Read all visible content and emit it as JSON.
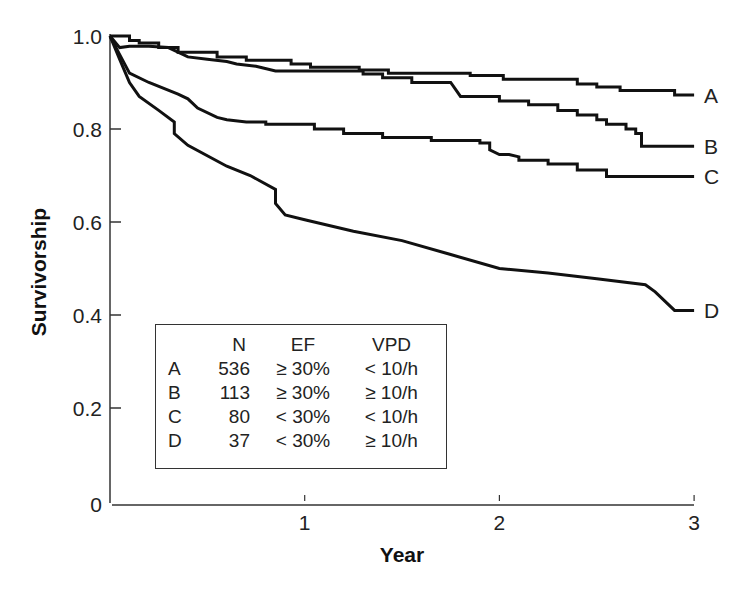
{
  "chart_data": {
    "type": "line",
    "title": "",
    "xlabel": "Year",
    "ylabel": "Survivorship",
    "xlim": [
      0,
      3
    ],
    "ylim": [
      0,
      1.0
    ],
    "x_ticks": [
      "1",
      "2",
      "3"
    ],
    "y_ticks": [
      "0",
      "0.2",
      "0.4",
      "0.6",
      "0.8",
      "1.0"
    ],
    "grid": false,
    "legend_position": "lower-left (inset table)",
    "series": [
      {
        "name": "A",
        "label": "A",
        "points": [
          [
            0,
            1.0
          ],
          [
            0.1,
            1.0
          ],
          [
            0.1,
            0.99
          ],
          [
            0.15,
            0.99
          ],
          [
            0.15,
            0.985
          ],
          [
            0.25,
            0.985
          ],
          [
            0.25,
            0.975
          ],
          [
            0.35,
            0.975
          ],
          [
            0.35,
            0.965
          ],
          [
            0.55,
            0.965
          ],
          [
            0.55,
            0.955
          ],
          [
            0.7,
            0.955
          ],
          [
            0.7,
            0.948
          ],
          [
            0.93,
            0.948
          ],
          [
            0.93,
            0.94
          ],
          [
            1.0,
            0.94
          ],
          [
            1.03,
            0.94
          ],
          [
            1.03,
            0.933
          ],
          [
            1.28,
            0.933
          ],
          [
            1.28,
            0.927
          ],
          [
            1.43,
            0.927
          ],
          [
            1.43,
            0.92
          ],
          [
            1.62,
            0.92
          ],
          [
            1.85,
            0.92
          ],
          [
            1.85,
            0.915
          ],
          [
            2.0,
            0.915
          ],
          [
            2.02,
            0.915
          ],
          [
            2.02,
            0.907
          ],
          [
            2.4,
            0.907
          ],
          [
            2.4,
            0.897
          ],
          [
            2.5,
            0.897
          ],
          [
            2.5,
            0.89
          ],
          [
            2.62,
            0.89
          ],
          [
            2.62,
            0.883
          ],
          [
            2.9,
            0.883
          ],
          [
            2.9,
            0.873
          ],
          [
            3.0,
            0.873
          ]
        ]
      },
      {
        "name": "B",
        "label": "B",
        "points": [
          [
            0,
            1.0
          ],
          [
            0.05,
            0.975
          ],
          [
            0.1,
            0.978
          ],
          [
            0.2,
            0.978
          ],
          [
            0.3,
            0.975
          ],
          [
            0.4,
            0.955
          ],
          [
            0.5,
            0.95
          ],
          [
            0.6,
            0.945
          ],
          [
            0.65,
            0.94
          ],
          [
            0.75,
            0.935
          ],
          [
            0.85,
            0.925
          ],
          [
            1.0,
            0.925
          ],
          [
            1.3,
            0.925
          ],
          [
            1.3,
            0.918
          ],
          [
            1.4,
            0.918
          ],
          [
            1.4,
            0.91
          ],
          [
            1.55,
            0.91
          ],
          [
            1.55,
            0.9
          ],
          [
            1.75,
            0.9
          ],
          [
            1.8,
            0.87
          ],
          [
            2.0,
            0.87
          ],
          [
            2.0,
            0.86
          ],
          [
            2.15,
            0.86
          ],
          [
            2.15,
            0.852
          ],
          [
            2.3,
            0.852
          ],
          [
            2.3,
            0.84
          ],
          [
            2.4,
            0.84
          ],
          [
            2.4,
            0.83
          ],
          [
            2.5,
            0.83
          ],
          [
            2.5,
            0.82
          ],
          [
            2.55,
            0.82
          ],
          [
            2.55,
            0.81
          ],
          [
            2.65,
            0.81
          ],
          [
            2.65,
            0.8
          ],
          [
            2.7,
            0.8
          ],
          [
            2.7,
            0.79
          ],
          [
            2.73,
            0.79
          ],
          [
            2.73,
            0.763
          ],
          [
            3.0,
            0.763
          ]
        ]
      },
      {
        "name": "C",
        "label": "C",
        "points": [
          [
            0,
            1.0
          ],
          [
            0.05,
            0.96
          ],
          [
            0.1,
            0.92
          ],
          [
            0.2,
            0.9
          ],
          [
            0.35,
            0.875
          ],
          [
            0.4,
            0.865
          ],
          [
            0.45,
            0.845
          ],
          [
            0.55,
            0.825
          ],
          [
            0.6,
            0.82
          ],
          [
            0.7,
            0.815
          ],
          [
            0.8,
            0.815
          ],
          [
            0.8,
            0.81
          ],
          [
            0.95,
            0.81
          ],
          [
            1.05,
            0.81
          ],
          [
            1.05,
            0.8
          ],
          [
            1.2,
            0.8
          ],
          [
            1.2,
            0.79
          ],
          [
            1.4,
            0.79
          ],
          [
            1.4,
            0.782
          ],
          [
            1.65,
            0.782
          ],
          [
            1.65,
            0.775
          ],
          [
            1.9,
            0.775
          ],
          [
            1.9,
            0.77
          ],
          [
            1.95,
            0.77
          ],
          [
            1.95,
            0.755
          ],
          [
            2.0,
            0.745
          ],
          [
            2.05,
            0.745
          ],
          [
            2.1,
            0.74
          ],
          [
            2.1,
            0.733
          ],
          [
            2.25,
            0.733
          ],
          [
            2.25,
            0.725
          ],
          [
            2.4,
            0.725
          ],
          [
            2.4,
            0.712
          ],
          [
            2.55,
            0.712
          ],
          [
            2.55,
            0.698
          ],
          [
            3.0,
            0.698
          ]
        ]
      },
      {
        "name": "D",
        "label": "D",
        "points": [
          [
            0,
            1.0
          ],
          [
            0.05,
            0.95
          ],
          [
            0.1,
            0.9
          ],
          [
            0.15,
            0.87
          ],
          [
            0.25,
            0.84
          ],
          [
            0.33,
            0.815
          ],
          [
            0.33,
            0.79
          ],
          [
            0.4,
            0.765
          ],
          [
            0.6,
            0.72
          ],
          [
            0.72,
            0.7
          ],
          [
            0.85,
            0.67
          ],
          [
            0.85,
            0.64
          ],
          [
            0.9,
            0.615
          ],
          [
            1.0,
            0.605
          ],
          [
            1.25,
            0.58
          ],
          [
            1.5,
            0.56
          ],
          [
            1.75,
            0.53
          ],
          [
            2.0,
            0.5
          ],
          [
            2.25,
            0.49
          ],
          [
            2.5,
            0.478
          ],
          [
            2.75,
            0.465
          ],
          [
            2.8,
            0.45
          ],
          [
            2.9,
            0.41
          ],
          [
            3.0,
            0.41
          ]
        ]
      }
    ],
    "legend_table": {
      "columns": [
        "",
        "N",
        "EF",
        "VPD"
      ],
      "rows": [
        {
          "group": "A",
          "N": "536",
          "EF": "≥ 30%",
          "VPD": "< 10/h"
        },
        {
          "group": "B",
          "N": "113",
          "EF": "≥ 30%",
          "VPD": "≥ 10/h"
        },
        {
          "group": "C",
          "N": "80",
          "EF": "< 30%",
          "VPD": "< 10/h"
        },
        {
          "group": "D",
          "N": "37",
          "EF": "< 30%",
          "VPD": "≥ 10/h"
        }
      ]
    },
    "end_values": {
      "A": 0.87,
      "B": 0.76,
      "C": 0.7,
      "D": 0.41
    }
  },
  "axes": {
    "xlabel": "Year",
    "ylabel": "Survivorship",
    "y_tick_labels": [
      "0",
      "0.2",
      "0.4",
      "0.6",
      "0.8",
      "1.0"
    ],
    "x_tick_labels": [
      "1",
      "2",
      "3"
    ]
  },
  "legend": {
    "headers": {
      "n": "N",
      "ef": "EF",
      "vpd": "VPD"
    },
    "rows": [
      {
        "key": "A",
        "n": "536",
        "ef": "≥ 30%",
        "vpd": "< 10/h"
      },
      {
        "key": "B",
        "n": "113",
        "ef": "≥ 30%",
        "vpd": "≥ 10/h"
      },
      {
        "key": "C",
        "n": "80",
        "ef": "< 30%",
        "vpd": "< 10/h"
      },
      {
        "key": "D",
        "n": "37",
        "ef": "< 30%",
        "vpd": "≥ 10/h"
      }
    ]
  }
}
